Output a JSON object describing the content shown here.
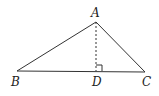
{
  "diagram": {
    "type": "triangle-with-altitude",
    "points": {
      "A": {
        "label": "A",
        "x": 96,
        "y": 22
      },
      "B": {
        "label": "B",
        "x": 17,
        "y": 71
      },
      "C": {
        "label": "C",
        "x": 145,
        "y": 72
      },
      "D": {
        "label": "D",
        "x": 96,
        "y": 71
      }
    },
    "segments": [
      {
        "from": "A",
        "to": "B",
        "style": "solid"
      },
      {
        "from": "A",
        "to": "C",
        "style": "solid"
      },
      {
        "from": "B",
        "to": "C",
        "style": "solid"
      },
      {
        "from": "A",
        "to": "D",
        "style": "dashed"
      }
    ],
    "right_angle_at": "D",
    "colors": {
      "stroke": "#333333",
      "background": "#ffffff"
    }
  }
}
